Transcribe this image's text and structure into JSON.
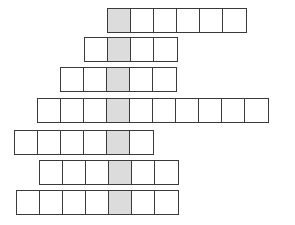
{
  "puzzle": {
    "type": "crossword-keyword",
    "shaded_color": "#dcdcdc",
    "border_color": "#3a3a3a",
    "cell_width": 24.5,
    "rows": [
      {
        "left": 107,
        "top": 8,
        "length": 6,
        "shaded_index": 0,
        "letters": [
          "",
          "",
          "",
          "",
          "",
          ""
        ]
      },
      {
        "left": 84,
        "top": 37,
        "length": 4,
        "shaded_index": 1,
        "letters": [
          "",
          "",
          "",
          ""
        ]
      },
      {
        "left": 60,
        "top": 67,
        "length": 5,
        "shaded_index": 2,
        "letters": [
          "",
          "",
          "",
          "",
          ""
        ]
      },
      {
        "left": 37,
        "top": 98,
        "length": 10,
        "shaded_index": 3,
        "letters": [
          "",
          "",
          "",
          "",
          "",
          "",
          "",
          "",
          "",
          ""
        ]
      },
      {
        "left": 14,
        "top": 130,
        "length": 6,
        "shaded_index": 4,
        "letters": [
          "",
          "",
          "",
          "",
          "",
          ""
        ]
      },
      {
        "left": 39,
        "top": 160,
        "length": 6,
        "shaded_index": 3,
        "letters": [
          "",
          "",
          "",
          "",
          "",
          ""
        ]
      },
      {
        "left": 16,
        "top": 190,
        "length": 7,
        "shaded_index": 4,
        "letters": [
          "",
          "",
          "",
          "",
          "",
          "",
          ""
        ]
      }
    ]
  }
}
